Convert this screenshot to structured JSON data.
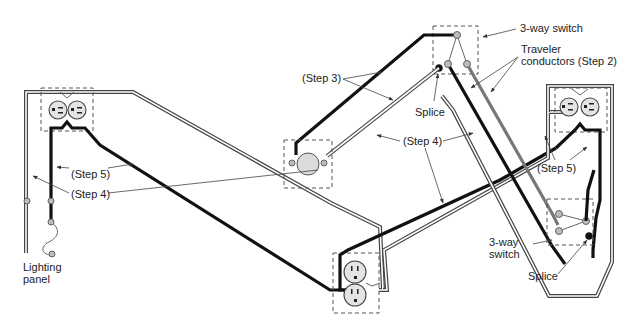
{
  "diagram": {
    "labels": {
      "three_way_switch_top": "3-way switch",
      "traveler_line1": "Traveler",
      "traveler_line2": "conductors (Step 2)",
      "step3": "(Step 3)",
      "splice_top": "Splice",
      "step4_center": "(Step 4)",
      "step5_right": "(Step 5)",
      "step5_left": "(Step 5)",
      "step4_left": "(Step 4)",
      "lighting_panel_line1": "Lighting",
      "lighting_panel_line2": "panel",
      "three_way_switch_bottom_line1": "3-way",
      "three_way_switch_bottom_line2": "switch",
      "splice_bottom": "Splice"
    },
    "components": [
      {
        "name": "lighting-panel",
        "type": "panel"
      },
      {
        "name": "left-duplex-receptacle",
        "type": "duplex receptacle"
      },
      {
        "name": "bottom-duplex-receptacle",
        "type": "duplex receptacle"
      },
      {
        "name": "right-duplex-receptacle",
        "type": "duplex receptacle"
      },
      {
        "name": "light-fixture",
        "type": "lamp"
      },
      {
        "name": "top-3-way-switch",
        "type": "3-way switch"
      },
      {
        "name": "bottom-3-way-switch",
        "type": "3-way switch"
      }
    ],
    "colors": {
      "hot_conductor": "#111111",
      "traveler_conductor": "#777777",
      "cable_sheath": "#444444",
      "terminal": "#bdbdbd",
      "splice": "#111111",
      "box_outline": "#555555"
    }
  }
}
